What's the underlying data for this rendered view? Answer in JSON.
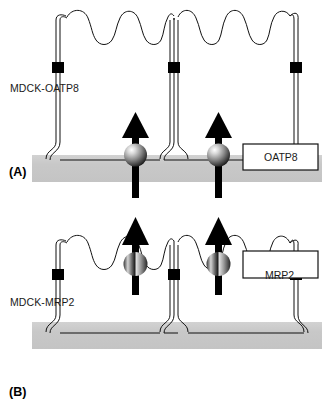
{
  "figure": {
    "width": 322,
    "height": 413,
    "background": "#ffffff"
  },
  "colors": {
    "stroke": "#111111",
    "membrane_line": "#111111",
    "tight_junction": "#000000",
    "support_band": "#c9c9c9",
    "arrow": "#000000",
    "box_fill": "#ffffff",
    "box_border": "#111111",
    "text": "#1a1a1a",
    "sphere_light": "#f2f2f2",
    "sphere_mid": "#8a8a8a",
    "sphere_dark": "#1a1a1a"
  },
  "panels": [
    {
      "id": "panel-a",
      "letter": "(A)",
      "cell_label": "MDCK-OATP8",
      "protein_label": "OATP8",
      "transporter_location": "basolateral",
      "transporter_count": 2,
      "arrow_direction": "up",
      "arrow_meaning": "uptake from basolateral compartment into cell",
      "sphere_style": "radial-shaded",
      "tight_junction_count": 3,
      "support_band_position": "bottom"
    },
    {
      "id": "panel-b",
      "letter": "(B)",
      "cell_label": "MDCK-MRP2",
      "protein_label": "MRP2",
      "transporter_location": "apical",
      "transporter_count": 2,
      "arrow_direction": "up",
      "arrow_meaning": "efflux from cell into apical compartment",
      "sphere_style": "split-shaded",
      "tight_junction_count": 3,
      "support_band_position": "bottom"
    }
  ]
}
